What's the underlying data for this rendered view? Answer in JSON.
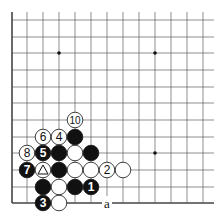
{
  "board": {
    "region": "lower-left corner",
    "columns": 13,
    "rows": 12,
    "col_x": [
      12,
      27,
      43,
      59,
      75,
      91,
      107,
      123,
      139,
      155,
      171,
      187,
      203
    ],
    "row_y": [
      20,
      37,
      53,
      70,
      87,
      103,
      120,
      137,
      153,
      170,
      187,
      203
    ],
    "star_points": [
      [
        3,
        2
      ],
      [
        9,
        2
      ],
      [
        9,
        8
      ]
    ],
    "line_color": "#333333"
  },
  "stones": [
    {
      "color": "white",
      "col": 4,
      "row": 6,
      "label": "10"
    },
    {
      "color": "white",
      "col": 2,
      "row": 7,
      "label": "6"
    },
    {
      "color": "white",
      "col": 3,
      "row": 7,
      "label": "4"
    },
    {
      "color": "black",
      "col": 4,
      "row": 7,
      "label": ""
    },
    {
      "color": "white",
      "col": 1,
      "row": 8,
      "label": "8"
    },
    {
      "color": "black",
      "col": 2,
      "row": 8,
      "label": "5"
    },
    {
      "color": "black",
      "col": 3,
      "row": 8,
      "label": ""
    },
    {
      "color": "white",
      "col": 4,
      "row": 8,
      "label": ""
    },
    {
      "color": "black",
      "col": 5,
      "row": 8,
      "label": ""
    },
    {
      "color": "black",
      "col": 1,
      "row": 9,
      "label": "7"
    },
    {
      "color": "white",
      "col": 2,
      "row": 9,
      "label": "",
      "mark": "triangle"
    },
    {
      "color": "black",
      "col": 3,
      "row": 9,
      "label": ""
    },
    {
      "color": "white",
      "col": 4,
      "row": 9,
      "label": ""
    },
    {
      "color": "white",
      "col": 5,
      "row": 9,
      "label": ""
    },
    {
      "color": "white",
      "col": 6,
      "row": 9,
      "label": "2"
    },
    {
      "color": "white",
      "col": 7,
      "row": 9,
      "label": ""
    },
    {
      "color": "black",
      "col": 2,
      "row": 10,
      "label": ""
    },
    {
      "color": "white",
      "col": 3,
      "row": 10,
      "label": ""
    },
    {
      "color": "black",
      "col": 4,
      "row": 10,
      "label": ""
    },
    {
      "color": "black",
      "col": 5,
      "row": 10,
      "label": "1"
    },
    {
      "color": "black",
      "col": 2,
      "row": 11,
      "label": "3"
    },
    {
      "color": "white",
      "col": 3,
      "row": 11,
      "label": ""
    }
  ],
  "markers": [
    {
      "col": 6,
      "row": 11,
      "label": "a"
    }
  ]
}
